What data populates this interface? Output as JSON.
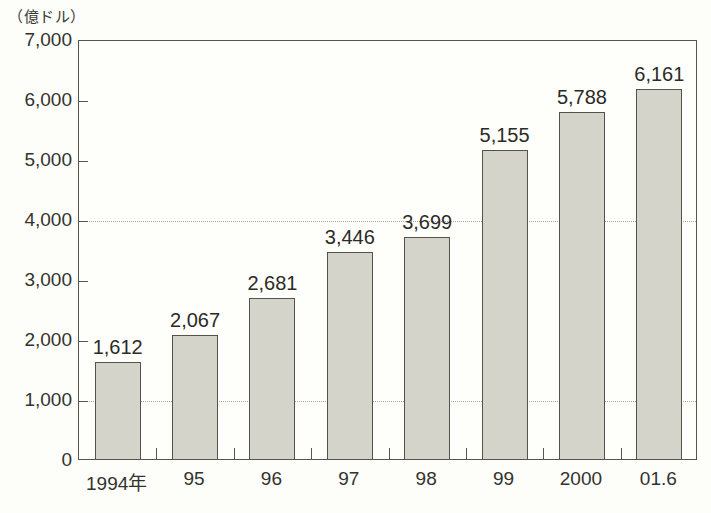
{
  "chart_data": {
    "type": "bar",
    "title": "",
    "unit_label": "（億ドル）",
    "xlabel": "",
    "ylabel": "",
    "categories": [
      "1994年",
      "95",
      "96",
      "97",
      "98",
      "99",
      "2000",
      "01.6"
    ],
    "values": [
      1612,
      2067,
      2681,
      3446,
      3699,
      5155,
      5788,
      6161
    ],
    "value_labels": [
      "1,612",
      "2,067",
      "2,681",
      "3,446",
      "3,699",
      "5,155",
      "5,788",
      "6,161"
    ],
    "ylim": [
      0,
      7000
    ],
    "ytick_values": [
      0,
      1000,
      2000,
      3000,
      4000,
      5000,
      6000,
      7000
    ],
    "ytick_labels": [
      "0",
      "1,000",
      "2,000",
      "3,000",
      "4,000",
      "5,000",
      "6,000",
      "7,000"
    ],
    "gridlines_at": [
      1000,
      4000
    ],
    "grid": "dotted-horizontal-partial",
    "legend": "none",
    "colors": {
      "bar_fill": "#d5d4cb",
      "bar_border": "#53534a",
      "axis": "#55554c",
      "gridline": "#a9a79a",
      "text": "#33332d",
      "background": "#fdfdfa"
    }
  }
}
